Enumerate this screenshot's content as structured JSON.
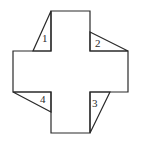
{
  "diagram": {
    "type": "geometry-figure",
    "line_color": "#2a2a2a",
    "background": "#ffffff",
    "cross": {
      "points": "51,11 90,11 90,51 128,51 128,92 90,92 90,133 51,133 51,92 13,92 13,51 51,51"
    },
    "triangles": [
      {
        "id": "1",
        "label": "1",
        "points": "51,11 33,51 51,51",
        "label_pos": [
          45,
          41
        ]
      },
      {
        "id": "2",
        "label": "2",
        "points": "90,32 128,51 90,51",
        "label_pos": [
          95,
          47
        ]
      },
      {
        "id": "3",
        "label": "3",
        "points": "110,92 90,133 90,92",
        "label_pos": [
          92,
          106
        ]
      },
      {
        "id": "4",
        "label": "4",
        "points": "13,92 51,112 51,92",
        "label_pos": [
          40,
          103
        ]
      }
    ]
  }
}
